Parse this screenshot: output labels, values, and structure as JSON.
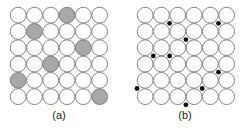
{
  "figure": {
    "grid_rows": 6,
    "grid_cols": 6,
    "colors": {
      "circle_fill": "#ffffff",
      "circle_stroke": "#777777",
      "shaded_fill": "#a8a8a8",
      "dot_fill": "#111111"
    },
    "panels": [
      {
        "id": "a",
        "label": "(a)",
        "description": "substitutional atoms",
        "shaded_cells": [
          [
            0,
            3
          ],
          [
            1,
            1
          ],
          [
            2,
            4
          ],
          [
            3,
            2
          ],
          [
            4,
            0
          ],
          [
            5,
            5
          ]
        ]
      },
      {
        "id": "b",
        "label": "(b)",
        "description": "interstitial atoms",
        "interstitial_corners": [
          [
            1,
            2
          ],
          [
            1,
            5
          ],
          [
            2,
            3
          ],
          [
            3,
            1
          ],
          [
            3,
            2
          ],
          [
            4,
            5
          ],
          [
            5,
            0
          ],
          [
            5,
            4
          ],
          [
            6,
            3
          ]
        ]
      }
    ]
  }
}
